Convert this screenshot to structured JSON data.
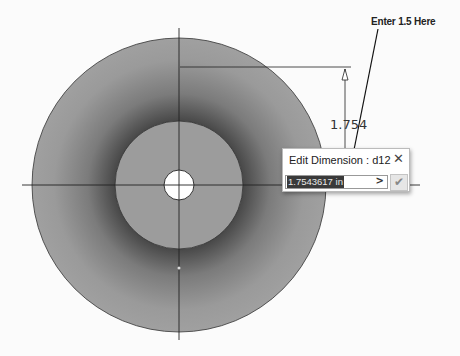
{
  "annotation": {
    "text": "Enter 1.5 Here"
  },
  "dimension": {
    "display_value": "1.754"
  },
  "dialog": {
    "title": "Edit Dimension : d12",
    "close_icon": "close-icon",
    "input_value": "1.7543617 in",
    "expand_icon": ">",
    "ok_icon": "✔"
  },
  "colors": {
    "part_fill": "#9a9a9a",
    "background": "#fbfbfb",
    "selection": "#3a3a3a"
  }
}
